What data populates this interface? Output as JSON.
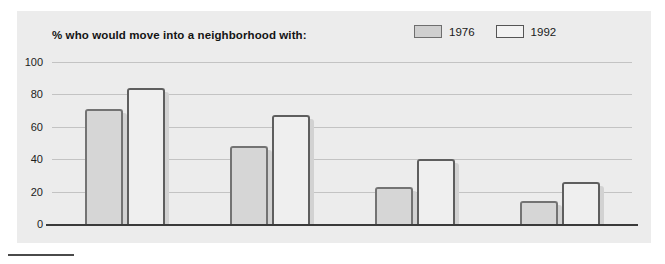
{
  "chart_data": {
    "type": "bar",
    "title": "% who would move into a neighborhood with:",
    "xlabel": "",
    "ylabel": "",
    "ylim": [
      0,
      100
    ],
    "yticks": [
      0,
      20,
      40,
      60,
      80,
      100
    ],
    "grid": true,
    "legend_position": "top-right",
    "categories": [
      "1 black household in 15",
      "3 black households in 15",
      "5 black households in 15",
      "7 black households in 15"
    ],
    "series": [
      {
        "name": "1976",
        "color": "#d6d6d6",
        "values": [
          71,
          48,
          23,
          14
        ]
      },
      {
        "name": "1992",
        "color": "#efefef",
        "values": [
          84,
          67,
          40,
          26
        ]
      }
    ]
  },
  "legend": {
    "items": [
      {
        "label": "1976",
        "swatch": "swatch-1976"
      },
      {
        "label": "1992",
        "swatch": "swatch-1992"
      }
    ]
  },
  "axis": {
    "y_ticks": [
      "100",
      "80",
      "60",
      "40",
      "20",
      "0"
    ]
  }
}
